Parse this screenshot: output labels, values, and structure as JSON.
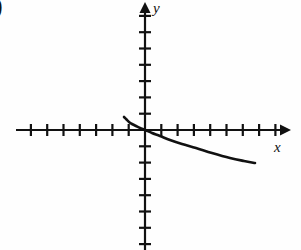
{
  "figure": {
    "item_marker": ")",
    "background_color": "#fefefe",
    "ink_color": "#111111"
  },
  "axes": {
    "x_label": "x",
    "y_label": "y",
    "origin_px": {
      "x": 145,
      "y": 130
    },
    "tick_spacing_px": 16.3,
    "x_axis_start_px": 16,
    "x_axis_end_px": 287,
    "y_axis_start_px": 5,
    "y_axis_end_px": 250,
    "x_arrowhead": "right",
    "y_arrowhead": "up",
    "tick_half_length_px": 5,
    "x_ticks_left_count": 7,
    "x_ticks_right_count": 8,
    "y_ticks_up_count": 7,
    "y_ticks_down_count": 7,
    "tick_labels": []
  },
  "chart_data": {
    "type": "line",
    "title": "",
    "xlabel": "x",
    "ylabel": "y",
    "grid": false,
    "legend": null,
    "xlim": [
      -8,
      9
    ],
    "ylim": [
      -7,
      7
    ],
    "series": [
      {
        "name": "curve",
        "style": "solid",
        "width_px": 2.6,
        "color": "#111111",
        "points_px": [
          {
            "x": 124,
            "y": 117
          },
          {
            "x": 126,
            "y": 119
          },
          {
            "x": 129,
            "y": 122
          },
          {
            "x": 132,
            "y": 124
          },
          {
            "x": 136,
            "y": 126
          },
          {
            "x": 140,
            "y": 128
          },
          {
            "x": 145,
            "y": 130
          },
          {
            "x": 152,
            "y": 133
          },
          {
            "x": 160,
            "y": 136
          },
          {
            "x": 170,
            "y": 140
          },
          {
            "x": 182,
            "y": 144
          },
          {
            "x": 196,
            "y": 148
          },
          {
            "x": 212,
            "y": 153
          },
          {
            "x": 230,
            "y": 158
          },
          {
            "x": 244,
            "y": 161
          },
          {
            "x": 255,
            "y": 163
          }
        ],
        "points_data": [
          {
            "x": -1.3,
            "y": 0.8
          },
          {
            "x": -1.17,
            "y": 0.68
          },
          {
            "x": -0.98,
            "y": 0.49
          },
          {
            "x": -0.8,
            "y": 0.37
          },
          {
            "x": -0.55,
            "y": 0.25
          },
          {
            "x": -0.31,
            "y": 0.12
          },
          {
            "x": 0.0,
            "y": 0.0
          },
          {
            "x": 0.43,
            "y": -0.18
          },
          {
            "x": 0.92,
            "y": -0.37
          },
          {
            "x": 1.53,
            "y": -0.61
          },
          {
            "x": 2.27,
            "y": -0.86
          },
          {
            "x": 3.13,
            "y": -1.1
          },
          {
            "x": 4.11,
            "y": -1.41
          },
          {
            "x": 5.21,
            "y": -1.72
          },
          {
            "x": 6.07,
            "y": -1.9
          },
          {
            "x": 6.75,
            "y": -2.02
          }
        ]
      }
    ]
  }
}
